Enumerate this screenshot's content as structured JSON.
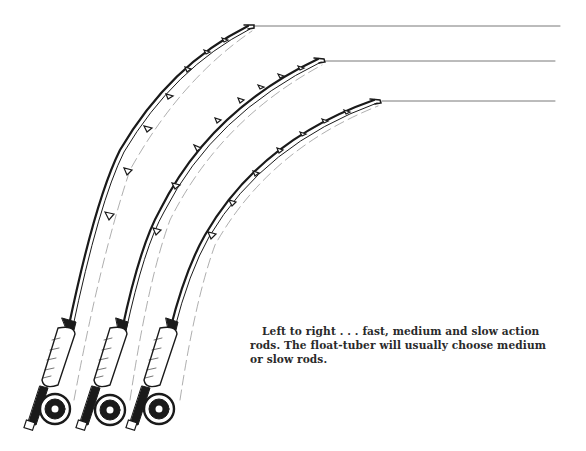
{
  "figure": {
    "rods": [
      {
        "label": "fast action rod",
        "position": "left"
      },
      {
        "label": "medium action rod",
        "position": "center"
      },
      {
        "label": "slow action rod",
        "position": "right"
      }
    ],
    "colors": {
      "ink": "#1a1a1a",
      "paper": "#ffffff"
    }
  },
  "caption": {
    "lines": [
      "Left to right . . . fast, medium and slow action",
      "rods. The float-tuber will usually choose medium",
      "or slow rods."
    ]
  }
}
